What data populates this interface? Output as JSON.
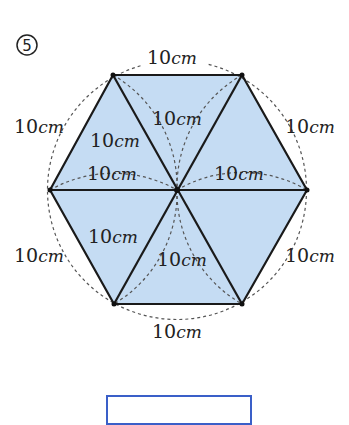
{
  "problem": {
    "number": "5",
    "number_glyph": "⑤"
  },
  "figure": {
    "shape": "regular hexagon composed of 6 equilateral triangles",
    "fill_color": "#c5dcf3",
    "stroke_color": "#1a1a1a",
    "dashed_color": "#555555",
    "center": [
      177,
      190
    ],
    "radius": 129,
    "vertices": {
      "top_left": [
        113,
        75
      ],
      "top_right": [
        242,
        75
      ],
      "right": [
        307,
        190
      ],
      "bottom_right": [
        242,
        304
      ],
      "bottom_left": [
        114,
        304
      ],
      "left": [
        50,
        190
      ]
    },
    "labels": [
      {
        "id": "top",
        "value": "10",
        "unit": "cm",
        "x": 147,
        "y": 64
      },
      {
        "id": "upper-left",
        "value": "10",
        "unit": "cm",
        "x": 14,
        "y": 133
      },
      {
        "id": "upper-right",
        "value": "10",
        "unit": "cm",
        "x": 285,
        "y": 133
      },
      {
        "id": "lower-left",
        "value": "10",
        "unit": "cm",
        "x": 14,
        "y": 262
      },
      {
        "id": "lower-right",
        "value": "10",
        "unit": "cm",
        "x": 285,
        "y": 262
      },
      {
        "id": "bottom",
        "value": "10",
        "unit": "cm",
        "x": 152,
        "y": 338
      },
      {
        "id": "inner-upper-left",
        "value": "10",
        "unit": "cm",
        "x": 90,
        "y": 147
      },
      {
        "id": "inner-upper-center",
        "value": "10",
        "unit": "cm",
        "x": 152,
        "y": 125
      },
      {
        "id": "inner-left-mid",
        "value": "10",
        "unit": "cm",
        "x": 87,
        "y": 180
      },
      {
        "id": "inner-right-mid",
        "value": "10",
        "unit": "cm",
        "x": 214,
        "y": 180
      },
      {
        "id": "inner-lower-left",
        "value": "10",
        "unit": "cm",
        "x": 88,
        "y": 243
      },
      {
        "id": "inner-lower-center",
        "value": "10",
        "unit": "cm",
        "x": 157,
        "y": 266
      }
    ]
  },
  "answer_box": {
    "border_color": "#3a5fc8",
    "value": ""
  }
}
